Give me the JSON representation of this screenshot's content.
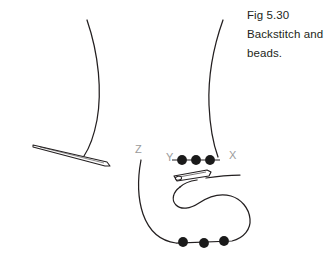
{
  "figure": {
    "caption_lines": [
      "Fig 5.30",
      "Backstitch and",
      "beads."
    ],
    "caption_text": "Fig 5.30 Backstitch and beads.",
    "point_labels": {
      "x": "X",
      "y": "Y",
      "z": "Z"
    },
    "colors": {
      "ink": "#231f20",
      "label_gray": "#9b9b9b",
      "bead_fill": "#1a1a1a",
      "background": "#ffffff"
    },
    "beads": {
      "top_row_count": 3,
      "bottom_row_count": 3,
      "radius": 4.8
    },
    "elements": {
      "loose_needle": "loose-needle",
      "threaded_needle": "threaded-needle",
      "fabric_edge_left": "fabric-edge-left-curve",
      "fabric_edge_right": "fabric-edge-right-curve",
      "thread_loop": "working-thread-loop"
    }
  }
}
